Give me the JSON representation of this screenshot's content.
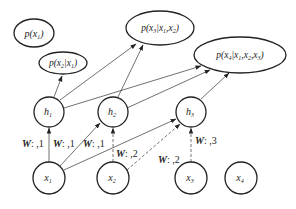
{
  "diagram": {
    "type": "autoregressive-network (NADE-style)",
    "outputs": [
      {
        "id": "p1",
        "label": "p(x1)",
        "main": "p(x",
        "sub": "1",
        "rest": ")"
      },
      {
        "id": "p2",
        "label": "p(x2|x1)",
        "main": "p(x",
        "sub": "2",
        "cond": "|x",
        "csub": "1",
        "rest": ")"
      },
      {
        "id": "p3",
        "label": "p(x3|x1,x2)"
      },
      {
        "id": "p4",
        "label": "p(x4|x1,x2,x3)"
      }
    ],
    "hidden": [
      {
        "id": "h1",
        "label": "h",
        "sub": "1"
      },
      {
        "id": "h2",
        "label": "h",
        "sub": "2"
      },
      {
        "id": "h3",
        "label": "h",
        "sub": "3"
      }
    ],
    "inputs": [
      {
        "id": "x1",
        "label": "x",
        "sub": "1"
      },
      {
        "id": "x2",
        "label": "x",
        "sub": "2"
      },
      {
        "id": "x3",
        "label": "x",
        "sub": "3"
      },
      {
        "id": "x4",
        "label": "x",
        "sub": "4"
      }
    ],
    "weight_labels": [
      {
        "w": "W",
        "rest": ": ,1"
      },
      {
        "w": "W",
        "rest": ": ,1"
      },
      {
        "w": "W",
        "rest": ": ,1"
      },
      {
        "w": "W",
        "rest": ": ,2"
      },
      {
        "w": "W",
        "rest": ": ,2"
      },
      {
        "w": "W",
        "rest": ": ,3"
      }
    ],
    "edges": [
      {
        "from": "x1",
        "to": "h1",
        "style": "solid",
        "label": "W: ,1"
      },
      {
        "from": "x1",
        "to": "h2",
        "style": "solid",
        "label": "W: ,1"
      },
      {
        "from": "x1",
        "to": "h3",
        "style": "solid",
        "label": "W: ,1"
      },
      {
        "from": "x2",
        "to": "h2",
        "style": "dashed",
        "label": "W: ,2"
      },
      {
        "from": "x2",
        "to": "h3",
        "style": "dashed",
        "label": "W: ,2"
      },
      {
        "from": "x3",
        "to": "h3",
        "style": "dashed",
        "label": "W: ,3"
      },
      {
        "from": "h1",
        "to": "p2",
        "style": "solid"
      },
      {
        "from": "h1",
        "to": "p3",
        "style": "solid"
      },
      {
        "from": "h1",
        "to": "p4",
        "style": "solid"
      },
      {
        "from": "h2",
        "to": "p3",
        "style": "solid"
      },
      {
        "from": "h2",
        "to": "p4",
        "style": "solid"
      },
      {
        "from": "h3",
        "to": "p4",
        "style": "solid"
      }
    ]
  }
}
